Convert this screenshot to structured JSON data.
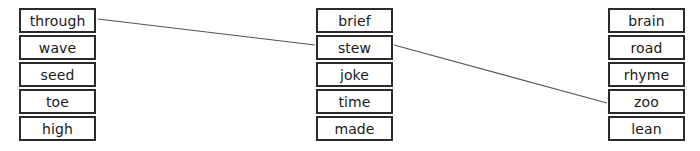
{
  "diagram": {
    "type": "word-matching-exercise",
    "background_color": "#ffffff",
    "box_border_color": "#2b2b2b",
    "text_color": "#1a1a1a",
    "line_color": "#555555",
    "columns": [
      {
        "name": "left-column",
        "words": [
          "through",
          "wave",
          "seed",
          "toe",
          "high"
        ]
      },
      {
        "name": "middle-column",
        "words": [
          "brief",
          "stew",
          "joke",
          "time",
          "made"
        ]
      },
      {
        "name": "right-column",
        "words": [
          "brain",
          "road",
          "rhyme",
          "zoo",
          "lean"
        ]
      }
    ],
    "connections": [
      {
        "name": "through-to-stew",
        "from": "through",
        "to": "stew",
        "x1": 98,
        "y1": 19,
        "x2": 315,
        "y2": 45
      },
      {
        "name": "stew-to-zoo",
        "from": "stew",
        "to": "zoo",
        "x1": 394,
        "y1": 45,
        "x2": 607,
        "y2": 103
      }
    ]
  }
}
